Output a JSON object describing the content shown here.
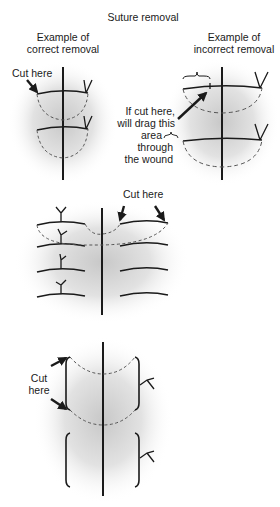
{
  "title": "Suture removal",
  "panels": {
    "correct": {
      "heading_line1": "Example of",
      "heading_line2": "correct removal",
      "label": "Cut here"
    },
    "incorrect": {
      "heading_line1": "Example of",
      "heading_line2": "incorrect removal",
      "annotation_lines": [
        "If cut here,",
        "will drag this",
        "area",
        "through",
        "the wound"
      ]
    },
    "continuous": {
      "label": "Cut here"
    },
    "vertical_mattress": {
      "label_line1": "Cut",
      "label_line2": "here"
    }
  },
  "colors": {
    "ink": "#1a1a1a",
    "skin_shadow": "#cfcfcf",
    "dashed": "#555555"
  }
}
